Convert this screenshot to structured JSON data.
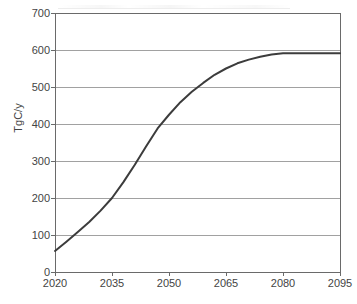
{
  "chart_data": {
    "type": "line",
    "title": "",
    "subtitle": "",
    "xlabel": "",
    "ylabel": "TgC/y",
    "xlim": [
      2020,
      2095
    ],
    "ylim": [
      0,
      700
    ],
    "grid": true,
    "grid_axis": "y",
    "legend": false,
    "legend_position": "none",
    "x_ticks": [
      2020,
      2035,
      2050,
      2065,
      2080,
      2095
    ],
    "x_tick_labels": [
      "2020",
      "2035",
      "2050",
      "2065",
      "2080",
      "2095"
    ],
    "y_ticks": [
      0,
      100,
      200,
      300,
      400,
      500,
      600,
      700
    ],
    "y_tick_labels": [
      "0",
      "100",
      "200",
      "300",
      "400",
      "500",
      "600",
      "700"
    ],
    "series": [
      {
        "name": "emissions",
        "color": "#3c3c3c",
        "line_width": 2,
        "x": [
          2020,
          2023,
          2026,
          2029,
          2032,
          2035,
          2038,
          2041,
          2044,
          2047,
          2050,
          2053,
          2056,
          2059,
          2062,
          2065,
          2068,
          2071,
          2074,
          2077,
          2080,
          2083,
          2086,
          2089,
          2092,
          2095
        ],
        "y": [
          57,
          82,
          108,
          135,
          166,
          200,
          243,
          290,
          340,
          388,
          425,
          459,
          487,
          511,
          533,
          550,
          564,
          574,
          582,
          588,
          591,
          591,
          591,
          591,
          591,
          591
        ]
      }
    ],
    "annotations": [],
    "colors": {
      "line": "#3c3c3c",
      "axis": "#6a6a6a",
      "grid": "#8a8a8a",
      "text": "#444444",
      "background": "#ffffff"
    },
    "plot_area": {
      "left": 55,
      "right": 340,
      "top": 13,
      "bottom": 272
    }
  }
}
